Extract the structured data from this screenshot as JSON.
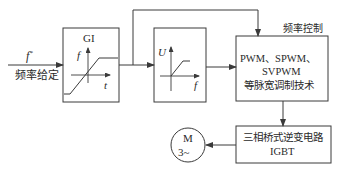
{
  "input": {
    "symbol": "f*",
    "symbol_base": "f",
    "symbol_sup": "*",
    "label": "频率给定"
  },
  "gi_block": {
    "title": "GI",
    "y_axis": "f",
    "x_axis": "t"
  },
  "uf_block": {
    "y_axis": "U",
    "x_axis": "f"
  },
  "pwm_block": {
    "caption": "频率控制",
    "line1": "PWM、SPWM、",
    "line2": "SVPWM",
    "line3": "等脉宽调制技术"
  },
  "inverter_block": {
    "line1": "三相桥式逆变电路",
    "line2": "IGBT"
  },
  "motor": {
    "line1": "M",
    "line2": "3~"
  },
  "colors": {
    "stroke": "#3a3a3a",
    "text": "#2a2a2a",
    "background": "#ffffff"
  }
}
